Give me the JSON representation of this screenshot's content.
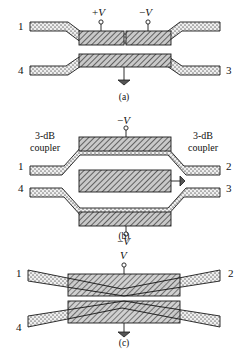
{
  "figure": {
    "type": "optical-waveguide-switch-diagram",
    "panel_count": 3
  },
  "colors": {
    "line": "#1a1a1a",
    "waveguide_fill": "#e8e8e8",
    "electrode_fill": "#bcbcbc",
    "background": "#ffffff",
    "text": "#111111"
  },
  "panels": [
    {
      "id": "a",
      "caption": "(a)",
      "ports": {
        "top_left": "1",
        "bottom_left": "4",
        "bottom_right": "3",
        "top_right": ""
      },
      "electrodes": [
        {
          "id": "a-top-left-electrode",
          "label": "+V",
          "sign": "+",
          "symbol": "V"
        },
        {
          "id": "a-top-right-electrode",
          "label": "−V",
          "sign": "−",
          "symbol": "V"
        },
        {
          "id": "a-bottom-electrode",
          "label": "",
          "sign": "",
          "symbol": ""
        }
      ],
      "ground_symbols": 1
    },
    {
      "id": "b",
      "caption": "(b)",
      "ports": {
        "top_left": "1",
        "bottom_left": "4",
        "top_right": "2",
        "bottom_right": "3"
      },
      "annotations": [
        {
          "id": "b-left-coupler",
          "line1": "3-dB",
          "line2": "coupler"
        },
        {
          "id": "b-right-coupler",
          "line1": "3-dB",
          "line2": "coupler"
        }
      ],
      "electrodes": [
        {
          "id": "b-top-electrode",
          "label": "−V",
          "sign": "−",
          "symbol": "V"
        },
        {
          "id": "b-center-electrode",
          "label": "",
          "sign": "",
          "symbol": ""
        },
        {
          "id": "b-bottom-electrode",
          "label": "−V",
          "sign": "−",
          "symbol": "V"
        }
      ],
      "ground_symbols": 1
    },
    {
      "id": "c",
      "caption": "(c)",
      "ports": {
        "top_left": "1",
        "bottom_left": "4",
        "top_right": "2",
        "bottom_right": ""
      },
      "electrodes": [
        {
          "id": "c-electrode",
          "label": "V",
          "sign": "",
          "symbol": "V"
        }
      ],
      "ground_symbols": 1
    }
  ],
  "panel_a": {
    "caption": "(a)",
    "port_1": "1",
    "port_4": "4",
    "port_3": "3",
    "electrode_pos_sign": "+",
    "electrode_pos_symbol": "V",
    "electrode_neg_sign": "−",
    "electrode_neg_symbol": "V"
  },
  "panel_b": {
    "caption": "(b)",
    "port_1": "1",
    "port_2": "2",
    "port_3": "3",
    "port_4": "4",
    "coupler_left_line1": "3-dB",
    "coupler_left_line2": "coupler",
    "coupler_right_line1": "3-dB",
    "coupler_right_line2": "coupler",
    "electrode_top_sign": "−",
    "electrode_top_symbol": "V",
    "electrode_bottom_sign": "−",
    "electrode_bottom_symbol": "V"
  },
  "panel_c": {
    "caption": "(c)",
    "port_1": "1",
    "port_2": "2",
    "port_4": "4",
    "electrode_symbol": "V"
  }
}
